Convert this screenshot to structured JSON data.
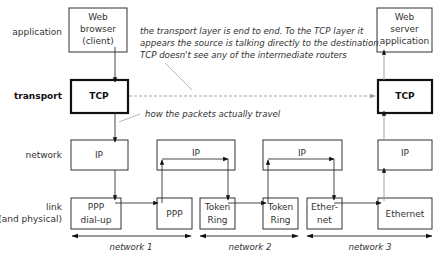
{
  "layers": {
    "application": "application",
    "transport": "transport",
    "network": "network",
    "link_line1": "link",
    "link_line2": "(and physical)"
  },
  "boxes": {
    "web_browser": [
      "Web",
      "browser",
      "(client)"
    ],
    "tcp_left": "TCP",
    "ip_left": "IP",
    "ppp_dialup": [
      "PPP",
      "dial-up"
    ],
    "ppp": "PPP",
    "ip_router1": "IP",
    "token_ring_1": [
      "Token",
      "Ring"
    ],
    "ip_router2": "IP",
    "token_ring_2": [
      "Token",
      "Ring"
    ],
    "ethernet_1": [
      "Ether-",
      "net"
    ],
    "web_server": [
      "Web",
      "server",
      "application"
    ],
    "tcp_right": "TCP",
    "ip_right": "IP",
    "ethernet_right": "Ethernet"
  },
  "notes": {
    "transport_note": [
      "the transport layer is end to end. To the TCP layer it",
      "appears the source is talking directly to the destination.",
      "TCP doesn't see any of the intermediate routers"
    ],
    "packets_note": "how the packets actually travel"
  },
  "networks": [
    "network 1",
    "network 2",
    "network 3"
  ]
}
